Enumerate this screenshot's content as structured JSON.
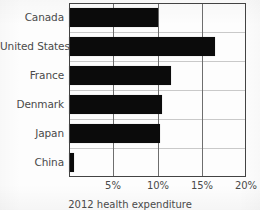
{
  "chart_data": {
    "type": "bar",
    "orientation": "horizontal",
    "title": "",
    "caption": "2012 health expenditure",
    "xlabel": "",
    "ylabel": "",
    "categories": [
      "Canada",
      "United States",
      "France",
      "Denmark",
      "Japan",
      "China"
    ],
    "values": [
      10.0,
      16.5,
      11.5,
      10.5,
      10.3,
      0.6
    ],
    "value_unit": "%",
    "xlim": [
      0,
      20
    ],
    "xticks": [
      5,
      10,
      15,
      20
    ],
    "xtick_labels": [
      "5%",
      "10%",
      "15%",
      "20%"
    ],
    "grid": {
      "vertical": true,
      "horizontal": true,
      "vertical_color": "#6e6e6e",
      "horizontal_color": "#c9c9c9"
    },
    "legend": null,
    "bar_color": "#0b0b0b",
    "frame_color": "#3d3d3d",
    "label_color": "#4a4a4a",
    "background": "#fdfdfd"
  }
}
